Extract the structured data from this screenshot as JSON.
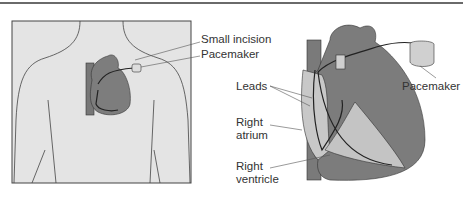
{
  "diagram": {
    "type": "medical-illustration",
    "panels": [
      {
        "id": "left",
        "description": "Torso outline with heart and implanted pacemaker",
        "labels": [
          "Small incision",
          "Pacemaker"
        ]
      },
      {
        "id": "right",
        "description": "Enlarged heart cross-section with pacemaker leads",
        "labels": [
          "Leads",
          "Right atrium",
          "Right ventricle",
          "Pacemaker"
        ]
      }
    ]
  },
  "labels": {
    "small_incision": "Small incision",
    "pacemaker_left": "Pacemaker",
    "leads": "Leads",
    "right_atrium_1": "Right",
    "right_atrium_2": "atrium",
    "right_ventricle_1": "Right",
    "right_ventricle_2": "ventricle",
    "pacemaker_right": "Pacemaker"
  },
  "colors": {
    "panel_bg": "#e4e4e4",
    "heart_dark": "#7a7a7a",
    "heart_light": "#c8c8c8",
    "line": "#555555"
  }
}
